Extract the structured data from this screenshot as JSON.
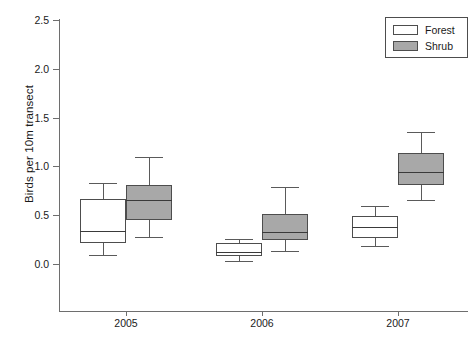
{
  "chart_data": {
    "type": "box",
    "title": "",
    "xlabel": "",
    "ylabel": "Birds per 10m transect",
    "categories": [
      "2005",
      "2006",
      "2007"
    ],
    "ylim": [
      0.0,
      2.5
    ],
    "ytick_labels": [
      "0.0",
      "0.5",
      "1.0",
      "1.5",
      "2.0",
      "2.5"
    ],
    "ytick_values": [
      0.0,
      0.5,
      1.0,
      1.5,
      2.0,
      2.5
    ],
    "grid": false,
    "legend_position": "top-right",
    "legend": [
      {
        "name": "Forest",
        "fill": "#ffffff"
      },
      {
        "name": "Shrub",
        "fill": "#a8a8a8"
      }
    ],
    "series": [
      {
        "name": "Forest",
        "fill": "#ffffff",
        "boxes": [
          {
            "category": "2005",
            "whisker_low": 0.09,
            "q1": 0.22,
            "median": 0.34,
            "q3": 0.67,
            "whisker_high": 0.83
          },
          {
            "category": "2006",
            "whisker_low": 0.03,
            "q1": 0.08,
            "median": 0.12,
            "q3": 0.22,
            "whisker_high": 0.26
          },
          {
            "category": "2007",
            "whisker_low": 0.18,
            "q1": 0.27,
            "median": 0.38,
            "q3": 0.49,
            "whisker_high": 0.59
          }
        ]
      },
      {
        "name": "Shrub",
        "fill": "#a8a8a8",
        "boxes": [
          {
            "category": "2005",
            "whisker_low": 0.28,
            "q1": 0.45,
            "median": 0.66,
            "q3": 0.81,
            "whisker_high": 1.1
          },
          {
            "category": "2006",
            "whisker_low": 0.13,
            "q1": 0.25,
            "median": 0.33,
            "q3": 0.51,
            "whisker_high": 0.79
          },
          {
            "category": "2007",
            "whisker_low": 0.66,
            "q1": 0.81,
            "median": 0.94,
            "q3": 1.14,
            "whisker_high": 1.35
          }
        ]
      }
    ]
  },
  "layout": {
    "plot_left": 59,
    "plot_right": 468,
    "y_zero_px": 264,
    "y_top_px": 20,
    "y_top_value": 2.5,
    "x_axis_px": 311,
    "box_width": 46,
    "group_centers_px": [
      126,
      262,
      398
    ],
    "series_offset_px": [
      -23,
      23
    ]
  }
}
